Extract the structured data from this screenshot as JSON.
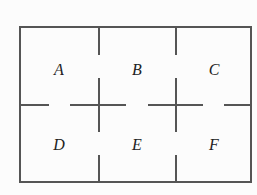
{
  "diagram": {
    "type": "floor-plan",
    "rooms": [
      {
        "id": "A",
        "label": "A",
        "x": 59,
        "y": 69
      },
      {
        "id": "B",
        "label": "B",
        "x": 137,
        "y": 69
      },
      {
        "id": "C",
        "label": "C",
        "x": 214,
        "y": 69
      },
      {
        "id": "D",
        "label": "D",
        "x": 59,
        "y": 144
      },
      {
        "id": "E",
        "label": "E",
        "x": 137,
        "y": 144
      },
      {
        "id": "F",
        "label": "F",
        "x": 214,
        "y": 144
      }
    ],
    "outer_frame": {
      "x": 20,
      "y": 27,
      "width": 231,
      "height": 155
    },
    "colors": {
      "wall": "#555555",
      "text": "#222222",
      "background": "#fcfcfc"
    }
  }
}
